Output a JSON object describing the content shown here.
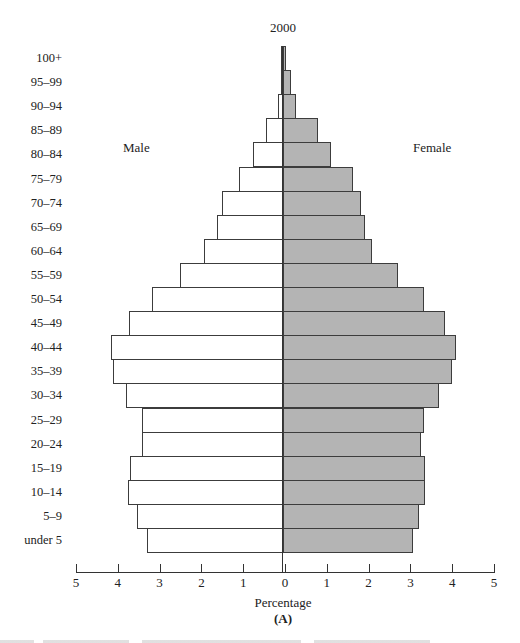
{
  "chart_data": {
    "type": "bar",
    "orientation": "horizontal",
    "subtype": "population-pyramid",
    "title": "2000",
    "xlabel": "Percentage",
    "panel_label": "(A)",
    "side_labels": {
      "left": "Male",
      "right": "Female"
    },
    "categories": [
      "100+",
      "95–99",
      "90–94",
      "85–89",
      "80–84",
      "75–79",
      "70–74",
      "65–69",
      "60–64",
      "55–59",
      "50–54",
      "45–49",
      "40–44",
      "35–39",
      "30–34",
      "25–29",
      "20–24",
      "15–19",
      "10–14",
      "5–9",
      "under 5"
    ],
    "series": [
      {
        "name": "Male",
        "color": "#ffffff",
        "values": [
          0.02,
          0.05,
          0.12,
          0.4,
          0.72,
          1.06,
          1.45,
          1.57,
          1.9,
          2.46,
          3.13,
          3.68,
          4.12,
          4.07,
          3.76,
          3.37,
          3.37,
          3.66,
          3.71,
          3.49,
          3.25
        ]
      },
      {
        "name": "Female",
        "color": "#b4b4b4",
        "values": [
          0.07,
          0.2,
          0.3,
          0.83,
          1.14,
          1.67,
          1.86,
          1.95,
          2.12,
          2.76,
          3.38,
          3.88,
          4.14,
          4.05,
          3.74,
          3.38,
          3.31,
          3.4,
          3.4,
          3.26,
          3.1
        ]
      }
    ],
    "xticks": [
      "5",
      "4",
      "3",
      "2",
      "1",
      "0",
      "1",
      "2",
      "3",
      "4",
      "5"
    ],
    "xlim": [
      -5,
      5
    ],
    "grid": false,
    "legend": "none (side labels)"
  }
}
